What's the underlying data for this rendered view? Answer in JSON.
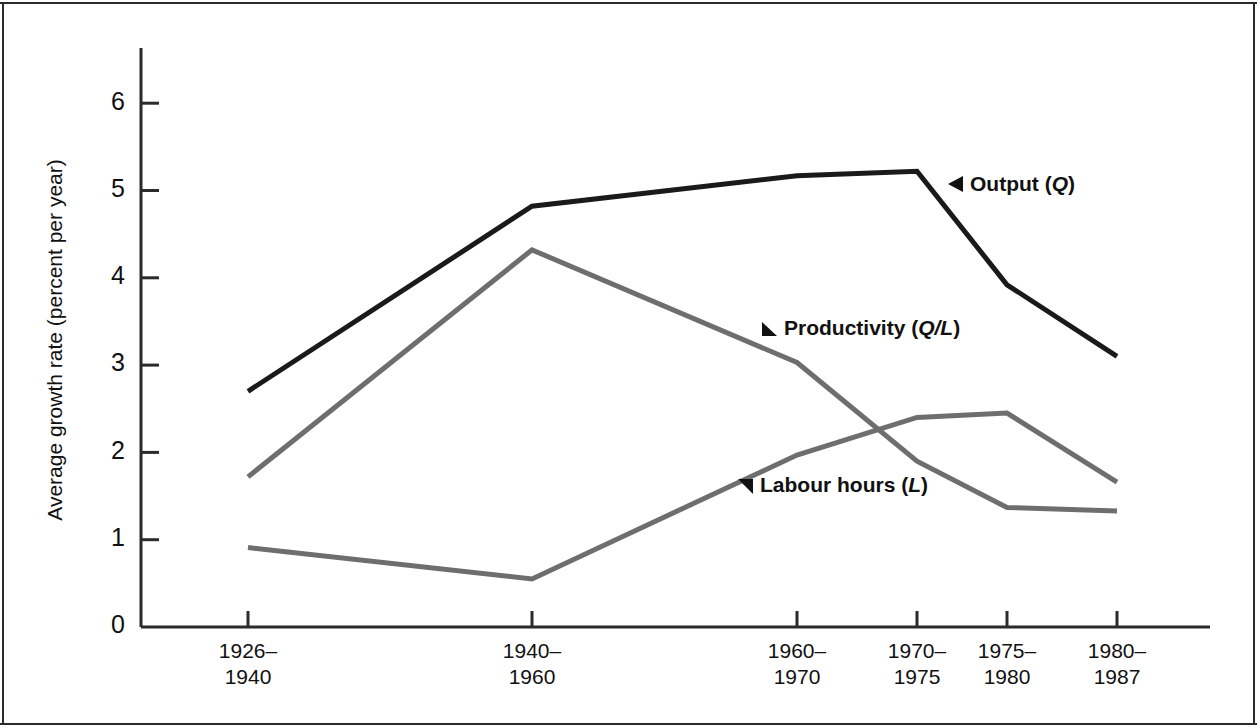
{
  "figure": {
    "background": "#ffffff",
    "frame_color": "#2b2b2b"
  },
  "chart_data": {
    "type": "line",
    "title": "",
    "xlabel": "",
    "ylabel": "Average growth rate (percent per year)",
    "categories": [
      "1926–\n1940",
      "1940–\n1960",
      "1960–\n1970",
      "1970–\n1975",
      "1975–\n1980",
      "1980–\n1987"
    ],
    "category_lines": [
      [
        "1926–",
        "1940"
      ],
      [
        "1940–",
        "1960"
      ],
      [
        "1960–",
        "1970"
      ],
      [
        "1970–",
        "1975"
      ],
      [
        "1975–",
        "1980"
      ],
      [
        "1980–",
        "1987"
      ]
    ],
    "ylim": [
      0,
      6.5
    ],
    "yticks": [
      0,
      1,
      2,
      3,
      4,
      5,
      6
    ],
    "ytick_labels": [
      "0",
      "1",
      "2",
      "3",
      "4",
      "5",
      "6"
    ],
    "grid": false,
    "legend": "inline-annotations",
    "series": [
      {
        "name": "Output (Q)",
        "label_plain": "Output",
        "label_symbol": "Q",
        "color": "#1a1a1a",
        "width": 5,
        "values": [
          2.7,
          4.82,
          5.17,
          5.22,
          3.92,
          3.1
        ]
      },
      {
        "name": "Productivity (Q/L)",
        "label_plain": "Productivity",
        "label_symbol": "Q/L",
        "color": "#6e6e6e",
        "width": 5,
        "values": [
          1.72,
          4.32,
          3.03,
          1.9,
          1.37,
          1.33
        ]
      },
      {
        "name": "Labour hours (L)",
        "label_plain": "Labour hours",
        "label_symbol": "L",
        "color": "#6e6e6e",
        "width": 5,
        "values": [
          0.91,
          0.55,
          1.97,
          2.4,
          2.45,
          1.66
        ]
      }
    ],
    "annotations": [
      {
        "text": "Output (Q)",
        "marker": "left-triangle",
        "x_px": 948,
        "y_px": 183
      },
      {
        "text": "Productivity (Q/L)",
        "marker": "up-left-triangle",
        "x_px": 762,
        "y_px": 325
      },
      {
        "text": "Labour hours (L)",
        "marker": "down-left-triangle",
        "x_px": 740,
        "y_px": 482
      }
    ]
  },
  "axis": {
    "y_title": "Average growth rate (percent per year)",
    "axis_color": "#2b2b2b"
  }
}
